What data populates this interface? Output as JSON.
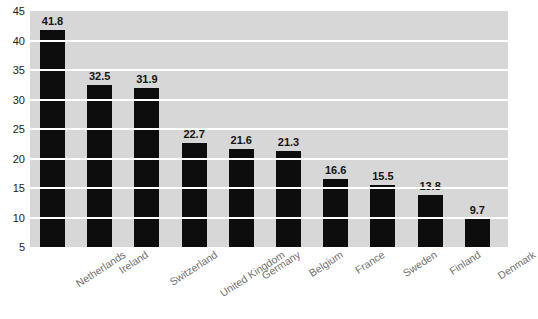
{
  "title_strip": {
    "text": "",
    "note": "chart title cropped off at top edge of screenshot"
  },
  "chart_data": {
    "type": "bar",
    "title": "",
    "subtitle": "",
    "xlabel": "",
    "ylabel": "",
    "categories": [
      "Netherlands",
      "Ireland",
      "Switzerland",
      "United Kingdom",
      "Germany",
      "Belgium",
      "France",
      "Sweden",
      "Finland",
      "Denmark"
    ],
    "values": [
      41.8,
      32.5,
      31.9,
      22.7,
      21.6,
      21.3,
      16.6,
      15.5,
      13.8,
      9.7
    ],
    "value_labels": [
      "41.8",
      "32.5",
      "31.9",
      "22.7",
      "21.6",
      "21.3",
      "16.6",
      "15.5",
      "13.8",
      "9.7"
    ],
    "ylim": [
      5,
      45
    ],
    "ytick_labels": [
      "45",
      "40",
      "35",
      "30",
      "25",
      "20",
      "15",
      "10",
      "5"
    ],
    "ytick_values": [
      45,
      40,
      35,
      30,
      25,
      20,
      15,
      10,
      5
    ],
    "grid": true,
    "grid_orientation": "horizontal",
    "legend": false,
    "legend_position": "none",
    "bar_color": "#0d0d0d",
    "plot_background_color": "#d7d7d7",
    "gridline_color": "#ffffff",
    "figure_background_color": "#ffffff",
    "category_label_color": "#6f6f6f",
    "category_label_rotation_deg": -33,
    "value_label_color": "#141414",
    "axis_tick_label_color": "#1a1a1a"
  }
}
